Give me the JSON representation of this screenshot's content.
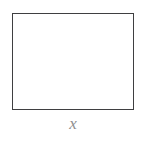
{
  "figure": {
    "shape": {
      "name": "rectangle",
      "stroke_color": "#3f3f41",
      "fill_color": "#ffffff",
      "stroke_width_px": 1.5,
      "x_px": 12,
      "y_px": 13,
      "width_px": 122,
      "height_px": 97
    },
    "labels": [
      {
        "name": "width-label",
        "text": "x",
        "style": "italic",
        "color": "#8e8e90",
        "position": "below-bottom-edge"
      }
    ],
    "background_color": "#ffffff"
  }
}
